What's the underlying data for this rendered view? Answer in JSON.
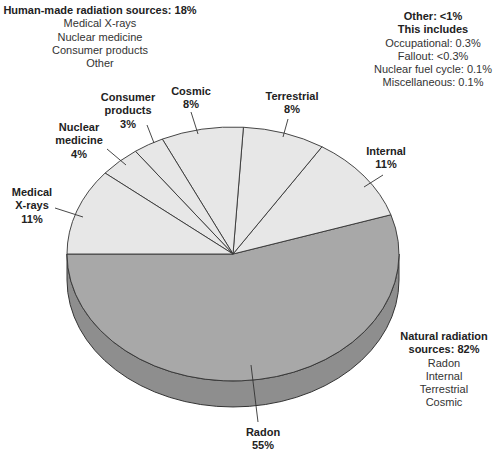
{
  "chart_data": {
    "type": "pie",
    "title": "",
    "style": "3d-tilted",
    "categories": [
      "Radon",
      "Internal",
      "Terrestrial",
      "Cosmic",
      "Consumer products",
      "Nuclear medicine",
      "Medical X-rays"
    ],
    "values": [
      55,
      11,
      8,
      8,
      3,
      4,
      11
    ],
    "value_labels": [
      "55%",
      "11%",
      "8%",
      "8%",
      "3%",
      "4%",
      "11%"
    ],
    "groups": [
      {
        "name": "Natural radiation sources",
        "total": "82%",
        "members": [
          "Radon",
          "Internal",
          "Terrestrial",
          "Cosmic"
        ]
      },
      {
        "name": "Human-made radiation sources",
        "total": "18%",
        "members": [
          "Medical X-rays",
          "Nuclear medicine",
          "Consumer products",
          "Other"
        ]
      }
    ],
    "other": {
      "total": "<1%",
      "breakdown": [
        {
          "name": "Occupational",
          "value": "0.3%"
        },
        {
          "name": "Fallout",
          "value": "<0.3%"
        },
        {
          "name": "Nuclear fuel cycle",
          "value": "0.1%"
        },
        {
          "name": "Miscellaneous",
          "value": "0.1%"
        }
      ]
    },
    "colors": {
      "natural_highlight": "#a8a8a8",
      "light": "#e7e7e7",
      "side": "#8e8e8e",
      "outline": "#333333"
    },
    "slice_colors": [
      "#a8a8a8",
      "#e7e7e7",
      "#e7e7e7",
      "#e7e7e7",
      "#e7e7e7",
      "#e7e7e7",
      "#e7e7e7"
    ]
  },
  "labels": {
    "human_made": {
      "title": "Human-made radiation sources: 18%",
      "items": [
        "Medical X-rays",
        "Nuclear medicine",
        "Consumer products",
        "Other"
      ]
    },
    "other": {
      "title": "Other: <1%",
      "subtitle": "This includes",
      "items": [
        "Occupational: 0.3%",
        "Fallout: <0.3%",
        "Nuclear fuel cycle: 0.1%",
        "Miscellaneous: 0.1%"
      ]
    },
    "natural": {
      "title_line1": "Natural radiation",
      "title_line2": "sources: 82%",
      "items": [
        "Radon",
        "Internal",
        "Terrestrial",
        "Cosmic"
      ]
    },
    "slices": {
      "cosmic": {
        "name": "Cosmic",
        "value": "8%"
      },
      "terrestrial": {
        "name": "Terrestrial",
        "value": "8%"
      },
      "consumer": {
        "name_line1": "Consumer",
        "name_line2": "products",
        "value": "3%"
      },
      "nuclear": {
        "name_line1": "Nuclear",
        "name_line2": "medicine",
        "value": "4%"
      },
      "medical": {
        "name_line1": "Medical",
        "name_line2": "X-rays",
        "value": "11%"
      },
      "internal": {
        "name": "Internal",
        "value": "11%"
      },
      "radon": {
        "name": "Radon",
        "value": "55%"
      }
    }
  }
}
